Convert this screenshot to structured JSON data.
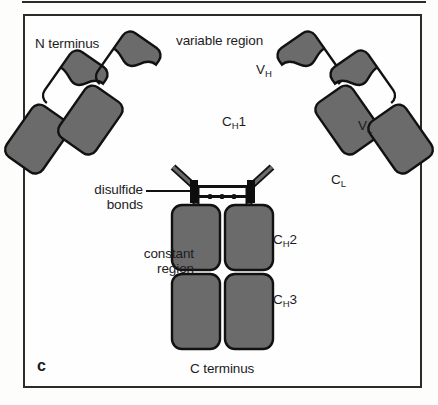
{
  "figure": {
    "panel_letter": "c",
    "labels": {
      "n_terminus": "N terminus",
      "variable_region": "variable region",
      "constant_region_line1": "constant",
      "constant_region_line2": "region",
      "disulfide_line1": "disulfide",
      "disulfide_line2": "bonds",
      "c_terminus": "C terminus"
    },
    "domain_labels": {
      "vh": "V",
      "vh_sub": "H",
      "vl": "V",
      "vl_sub": "L",
      "ch1": "C",
      "ch1_sub": "H",
      "ch1_num": "1",
      "cl": "C",
      "cl_sub": "L",
      "ch2": "C",
      "ch2_sub": "H",
      "ch2_num": "2",
      "ch3": "C",
      "ch3_sub": "H",
      "ch3_num": "3"
    },
    "colors": {
      "domain_fill": "#6b6b6b",
      "domain_stroke": "#111111",
      "background": "#fefefe",
      "border": "#2b2b2b",
      "text": "#1c1c1c",
      "hinge_bar": "#0d0d0d"
    },
    "geometry": {
      "panel": {
        "x": 23,
        "y": 14,
        "width": 399,
        "height": 374
      },
      "arm_tilt_left_deg": -35,
      "arm_tilt_right_deg": 35,
      "domain_count_per_light_chain": 2,
      "domain_count_per_heavy_chain": 4,
      "disulfide_bond_lines": 2
    }
  }
}
